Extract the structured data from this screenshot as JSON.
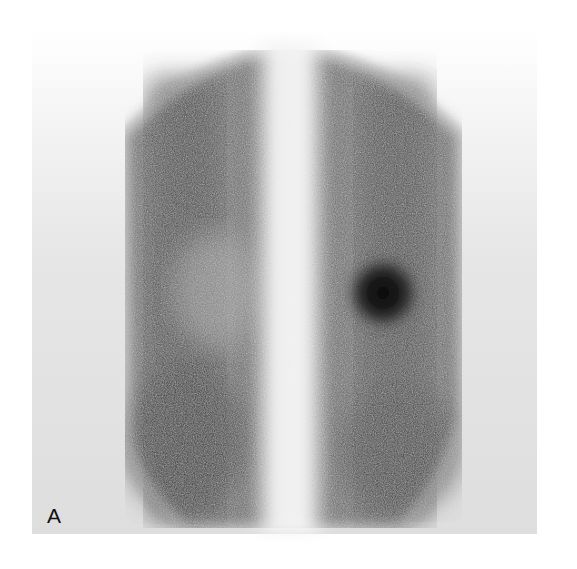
{
  "figure": {
    "panel_label": "A",
    "colors": {
      "background": "#ffffff",
      "panel": "#e0e0e0",
      "uptake_dark": "#1a1a1a",
      "uptake_mid": "#5a5a5a",
      "center_column": "#f2f2f2"
    },
    "features": {
      "hot_spot": {
        "cx": 383,
        "cy": 293,
        "r": 30
      },
      "center_column_x": 290
    }
  }
}
